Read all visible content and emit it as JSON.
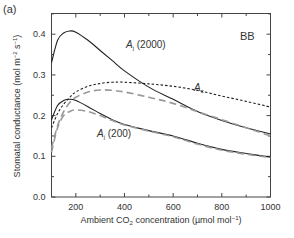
{
  "panel_label": "(a)",
  "corner_label": "BB",
  "chart_data": {
    "type": "line",
    "title": "",
    "panel": "(a)",
    "annotation": "BB",
    "xlabel": "Ambient CO2 concentration (µmol mol-1)",
    "xlabel_parts": {
      "main": "Ambient CO",
      "sub": "2",
      "rest": " concentration (µmol mol",
      "sup": "−1",
      "end": ")"
    },
    "ylabel": "Stomatal conductance (mol m-2 s-1)",
    "ylabel_parts": {
      "main": "Stomatal conductance (mol m",
      "sup1": "−2",
      "mid": " s",
      "sup2": "−1",
      "end": ")"
    },
    "xlim": [
      100,
      1000
    ],
    "ylim": [
      0.0,
      0.45
    ],
    "xticks": [
      200,
      400,
      600,
      800,
      1000
    ],
    "xtick_labels": [
      "200",
      "400",
      "600",
      "800",
      "1000"
    ],
    "yticks": [
      0.0,
      0.1,
      0.2,
      0.3,
      0.4
    ],
    "ytick_labels": [
      "0.0",
      "0.1",
      "0.2",
      "0.3",
      "0.4"
    ],
    "grid": false,
    "legend": "none (inline curve labels)",
    "x": [
      100,
      125,
      150,
      175,
      200,
      250,
      300,
      350,
      400,
      500,
      600,
      700,
      800,
      900,
      1000
    ],
    "series": [
      {
        "name": "Aj (2000)",
        "label_main": "A",
        "label_sub": "j",
        "label_rest": " (2000)",
        "style": "solid",
        "color": "#222222",
        "values": [
          0.33,
          0.385,
          0.403,
          0.408,
          0.405,
          0.385,
          0.36,
          0.335,
          0.31,
          0.27,
          0.24,
          0.21,
          0.188,
          0.17,
          0.155
        ]
      },
      {
        "name": "Ac",
        "label_main": "A",
        "label_sub": "c",
        "label_rest": "",
        "style": "short-dash",
        "color": "#222222",
        "values": [
          0.17,
          0.205,
          0.228,
          0.245,
          0.258,
          0.272,
          0.279,
          0.282,
          0.282,
          0.278,
          0.272,
          0.262,
          0.248,
          0.235,
          0.221
        ]
      },
      {
        "name": "Aj (2000) model",
        "style": "long-dash",
        "color": "#999999",
        "values": [
          0.12,
          0.175,
          0.21,
          0.232,
          0.245,
          0.258,
          0.263,
          0.262,
          0.258,
          0.245,
          0.23,
          0.21,
          0.19,
          0.17,
          0.15
        ]
      },
      {
        "name": "Aj (200)",
        "label_main": "A",
        "label_sub": "j",
        "label_rest": " (200)",
        "style": "solid",
        "color": "#222222",
        "values": [
          0.19,
          0.225,
          0.237,
          0.24,
          0.237,
          0.222,
          0.205,
          0.19,
          0.178,
          0.163,
          0.15,
          0.132,
          0.117,
          0.107,
          0.098
        ]
      },
      {
        "name": "Aj (200) model",
        "style": "long-dash",
        "color": "#999999",
        "values": [
          0.11,
          0.17,
          0.2,
          0.21,
          0.214,
          0.21,
          0.2,
          0.188,
          0.177,
          0.162,
          0.148,
          0.13,
          0.115,
          0.105,
          0.097
        ]
      }
    ]
  }
}
